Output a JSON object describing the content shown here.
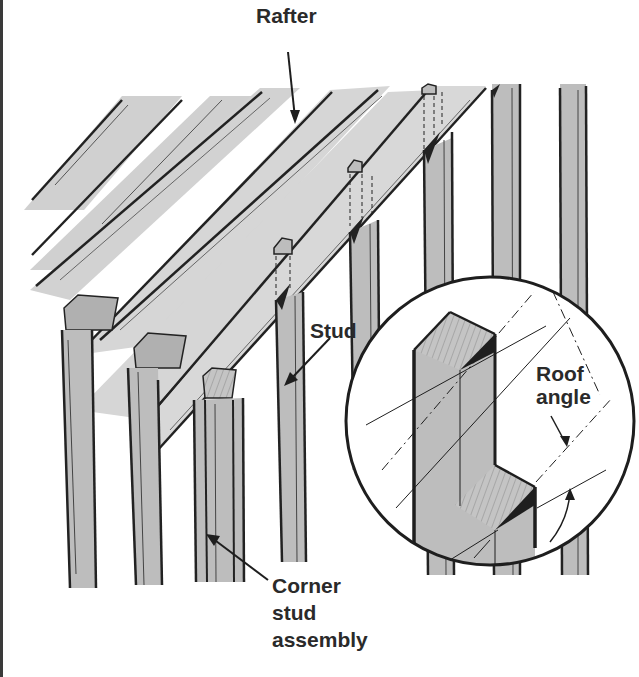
{
  "diagram": {
    "labels": {
      "rafter": "Rafter",
      "stud": "Stud",
      "roof_angle": [
        "Roof",
        "angle"
      ],
      "corner_stud_assembly": [
        "Corner",
        "stud",
        "assembly"
      ]
    },
    "inset": {
      "shape": "circle",
      "content": "Notched stud cut to roof angle"
    },
    "colors": {
      "background": "#ffffff",
      "wood_fill": "#bdbdbd",
      "wood_light": "#d4d4d4",
      "outline": "#1e1e1e",
      "text": "#2a2a2a"
    }
  }
}
